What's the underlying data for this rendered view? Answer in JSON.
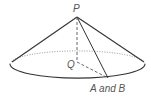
{
  "diagram": {
    "type": "cone",
    "labels": {
      "apex": "P",
      "center": "Q",
      "base_point": "A and B"
    },
    "colors": {
      "stroke": "#333333",
      "label": "#555555"
    }
  }
}
